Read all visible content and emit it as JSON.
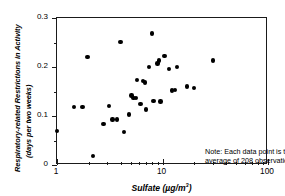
{
  "chart_data": {
    "type": "scatter",
    "title": "",
    "xlabel": "Sulfate (µg/m³)",
    "ylabel_line1": "Respiratory-related Restrictions in Activity",
    "ylabel_line2": "(days per two weeks)",
    "xscale": "log",
    "yscale": "linear",
    "xlim": [
      1,
      100
    ],
    "ylim": [
      0,
      0.3
    ],
    "grid": false,
    "legend": null,
    "xticks_major": [
      1,
      10,
      100
    ],
    "xtick_labels": [
      "1",
      "10",
      "100"
    ],
    "xticks_minor": [
      2,
      3,
      4,
      5,
      6,
      7,
      8,
      9,
      20,
      30,
      40,
      50,
      60,
      70,
      80,
      90
    ],
    "yticks_major": [
      0,
      0.1,
      0.2,
      0.3
    ],
    "ytick_labels": [
      "0",
      "0.1",
      "0.2",
      "0.3"
    ],
    "yticks_minor": [
      0.05,
      0.15,
      0.25
    ],
    "marker": "filled-circle",
    "marker_color": "#000000",
    "points": [
      {
        "x": 1.0,
        "y": 0.07
      },
      {
        "x": 1.45,
        "y": 0.118
      },
      {
        "x": 1.75,
        "y": 0.119
      },
      {
        "x": 1.95,
        "y": 0.221
      },
      {
        "x": 2.2,
        "y": 0.018
      },
      {
        "x": 2.75,
        "y": 0.084
      },
      {
        "x": 3.1,
        "y": 0.121
      },
      {
        "x": 3.35,
        "y": 0.093
      },
      {
        "x": 3.7,
        "y": 0.093
      },
      {
        "x": 4.0,
        "y": 0.251
      },
      {
        "x": 4.3,
        "y": 0.067
      },
      {
        "x": 4.8,
        "y": 0.103
      },
      {
        "x": 5.1,
        "y": 0.142
      },
      {
        "x": 5.3,
        "y": 0.137
      },
      {
        "x": 5.6,
        "y": 0.137
      },
      {
        "x": 5.7,
        "y": 0.174
      },
      {
        "x": 6.2,
        "y": 0.124
      },
      {
        "x": 6.5,
        "y": 0.171
      },
      {
        "x": 6.8,
        "y": 0.168
      },
      {
        "x": 7.0,
        "y": 0.113
      },
      {
        "x": 7.4,
        "y": 0.2
      },
      {
        "x": 7.9,
        "y": 0.268
      },
      {
        "x": 8.2,
        "y": 0.131
      },
      {
        "x": 9.0,
        "y": 0.207
      },
      {
        "x": 9.3,
        "y": 0.213
      },
      {
        "x": 9.6,
        "y": 0.13
      },
      {
        "x": 10.4,
        "y": 0.223
      },
      {
        "x": 11.5,
        "y": 0.196
      },
      {
        "x": 12.3,
        "y": 0.152
      },
      {
        "x": 13.2,
        "y": 0.153
      },
      {
        "x": 13.8,
        "y": 0.2
      },
      {
        "x": 17.0,
        "y": 0.16
      },
      {
        "x": 20.0,
        "y": 0.157
      },
      {
        "x": 30.0,
        "y": 0.213
      }
    ],
    "annotations": [
      {
        "name": "sample-size-note",
        "line1": "Note: Each data point is the",
        "line2": "average of 208 observations."
      }
    ]
  }
}
